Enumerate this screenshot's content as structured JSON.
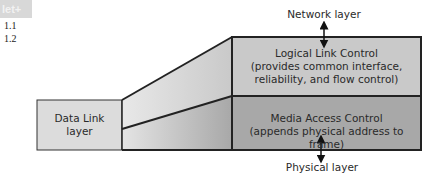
{
  "header": {
    "badge": "let+",
    "sections": [
      "1.1",
      "1.2"
    ]
  },
  "diagram": {
    "top_label": "Network layer",
    "bottom_label": "Physical layer",
    "data_link": {
      "line1": "Data Link",
      "line2": "layer"
    },
    "llc": {
      "title": "Logical Link Control",
      "line2": "(provides common interface,",
      "line3": "reliability, and flow control)"
    },
    "mac": {
      "title": "Media Access Control",
      "line2": "(appends physical address to frame)"
    },
    "colors": {
      "data_link_fill": "#dcdcdc",
      "llc_fill": "#c9c9c9",
      "mac_fill": "#a8a8a8",
      "outline": "#222222"
    }
  }
}
